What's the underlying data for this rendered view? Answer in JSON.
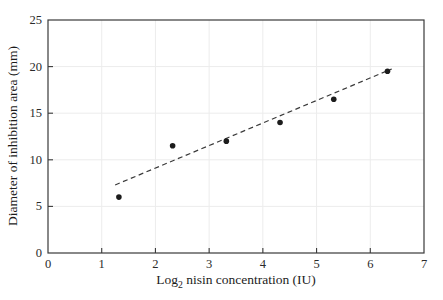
{
  "chart_data": {
    "type": "scatter",
    "title": "",
    "xlabel": {
      "pre": "Log",
      "sub": "2",
      "post": " nisin concentration (IU)"
    },
    "ylabel": "Diameter of inhibition area (mm)",
    "xlim": [
      0,
      7
    ],
    "ylim": [
      0,
      25
    ],
    "x_ticks": [
      0,
      1,
      2,
      3,
      4,
      5,
      6,
      7
    ],
    "y_ticks": [
      0,
      5,
      10,
      15,
      20,
      25
    ],
    "grid": {
      "show": true,
      "x_lines": [
        1,
        2,
        3,
        4,
        5,
        6
      ],
      "y_lines": [
        5,
        10,
        15,
        20
      ],
      "color": "#ececec"
    },
    "points": [
      {
        "x": 1.32,
        "y": 6.0
      },
      {
        "x": 2.32,
        "y": 11.5
      },
      {
        "x": 3.32,
        "y": 12.0
      },
      {
        "x": 4.32,
        "y": 14.0
      },
      {
        "x": 5.32,
        "y": 16.5
      },
      {
        "x": 6.32,
        "y": 19.5
      }
    ],
    "trendline": {
      "x1": 1.25,
      "y1": 7.3,
      "x2": 6.4,
      "y2": 19.75,
      "style": "dashed"
    },
    "legend": null,
    "colors": {
      "point": "#1c1c1c",
      "trendline": "#3a3a3a",
      "axis": "#3a3a3a",
      "tick_label": "#2a2a2a"
    }
  }
}
